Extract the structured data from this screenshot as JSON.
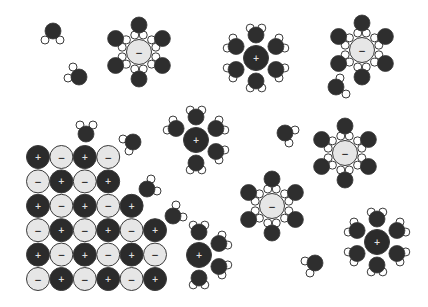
{
  "title": "Dissolution of an ionic crystal in water",
  "colors": {
    "background": "#ffffff",
    "cation_fill": "#2b2b2b",
    "anion_fill": "#e6e6e6",
    "outline": "#3a3a3a",
    "oxygen_fill": "#2e2e2e",
    "hydrogen_fill": "#ffffff",
    "cation_sign": "#e0e0e0",
    "anion_sign": "#333333"
  },
  "symbols": {
    "cation": "+",
    "anion": "−"
  },
  "sizes": {
    "lattice_ion_r": 11.5,
    "solvated_ion_r": 12.5,
    "oxygen_r": 8,
    "hydrogen_r": 4,
    "cation_water_dist": 23,
    "anion_water_dist": 27
  },
  "lattice": {
    "origin_x": 38,
    "origin_y": 157,
    "dx": 23.4,
    "dy": 24.4,
    "rows": [
      [
        "+",
        "-",
        "+",
        "-"
      ],
      [
        "-",
        "+",
        "-",
        "+"
      ],
      [
        "+",
        "-",
        "+",
        "-",
        "+"
      ],
      [
        "-",
        "+",
        "-",
        "+",
        "-",
        "+"
      ],
      [
        "+",
        "-",
        "+",
        "-",
        "+",
        "-"
      ],
      [
        "-",
        "+",
        "-",
        "+",
        "-",
        "+"
      ]
    ]
  },
  "anion_clusters": [
    {
      "x": 139,
      "y": 52,
      "waters": [
        90,
        30,
        -30,
        -90,
        -150,
        150
      ]
    },
    {
      "x": 362,
      "y": 50,
      "waters": [
        90,
        30,
        -30,
        -90,
        -150,
        150
      ]
    },
    {
      "x": 345,
      "y": 153,
      "waters": [
        90,
        30,
        -30,
        -90,
        -150,
        150
      ]
    },
    {
      "x": 272,
      "y": 206,
      "waters": [
        90,
        30,
        -30,
        -90,
        -150,
        150
      ]
    }
  ],
  "cation_clusters": [
    {
      "x": 256,
      "y": 58,
      "waters": [
        90,
        30,
        -30,
        -90,
        -150,
        150
      ]
    },
    {
      "x": 196,
      "y": 140,
      "waters": [
        90,
        30,
        -30,
        -90,
        150
      ]
    },
    {
      "x": 377,
      "y": 242,
      "waters": [
        90,
        30,
        -30,
        -90,
        -150,
        150
      ]
    },
    {
      "x": 199,
      "y": 255,
      "waters": [
        90,
        30,
        -30,
        -90
      ]
    }
  ],
  "free_waters": [
    {
      "ox": 53,
      "oy": 31,
      "h": [
        [
          45,
          40
        ],
        [
          60,
          40
        ]
      ]
    },
    {
      "ox": 79,
      "oy": 77,
      "h": [
        [
          73,
          67
        ],
        [
          68,
          78
        ]
      ]
    },
    {
      "ox": 336,
      "oy": 87,
      "h": [
        [
          340,
          78
        ],
        [
          346,
          94
        ]
      ]
    },
    {
      "ox": 285,
      "oy": 133,
      "h": [
        [
          295,
          130
        ],
        [
          289,
          143
        ]
      ]
    },
    {
      "ox": 86,
      "oy": 134,
      "h": [
        [
          80,
          125
        ],
        [
          93,
          125
        ]
      ]
    },
    {
      "ox": 133,
      "oy": 142,
      "h": [
        [
          123,
          139
        ],
        [
          129,
          151
        ]
      ]
    },
    {
      "ox": 147,
      "oy": 189,
      "h": [
        [
          151,
          179
        ],
        [
          157,
          191
        ]
      ]
    },
    {
      "ox": 173,
      "oy": 216,
      "h": [
        [
          176,
          205
        ],
        [
          183,
          217
        ]
      ]
    },
    {
      "ox": 315,
      "oy": 263,
      "h": [
        [
          305,
          261
        ],
        [
          310,
          273
        ]
      ]
    }
  ]
}
